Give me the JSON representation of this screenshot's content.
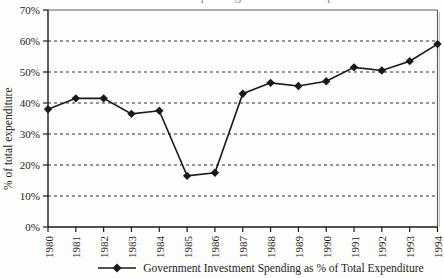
{
  "clipped_top_title": "Government Investment Spending as % of Total Expenditure",
  "chart_data": {
    "type": "line",
    "x": [
      "1980",
      "1981",
      "1982",
      "1983",
      "1984",
      "1985",
      "1986",
      "1987",
      "1988",
      "1989",
      "1990",
      "1991",
      "1992",
      "1993",
      "1994"
    ],
    "series": [
      {
        "name": "Government Investment Spending as % of Total Expenditure",
        "values": [
          38,
          41.5,
          41.5,
          36.5,
          37.5,
          16.5,
          17.5,
          43,
          46.5,
          45.5,
          47,
          51.5,
          50.5,
          53.5,
          59
        ]
      }
    ],
    "title": "",
    "xlabel": "",
    "ylabel": "% of total expenditure",
    "ylim": [
      0,
      70
    ],
    "ytick_step": 10,
    "ytick_labels": [
      "0%",
      "10%",
      "20%",
      "30%",
      "40%",
      "50%",
      "60%",
      "70%"
    ],
    "grid": "horizontal-dashed",
    "legend_position": "bottom",
    "marker": "diamond",
    "colors": {
      "line": "#1a1a1a",
      "marker": "#1a1a1a",
      "grid": "#2f2f2f",
      "axis": "#1a1a1a",
      "frame": "#5a5a5a",
      "frame_shadow": "#c0c0c0",
      "text": "#1c1c1c"
    }
  }
}
